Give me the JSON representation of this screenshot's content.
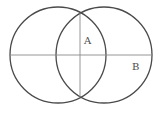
{
  "diagram": {
    "type": "two overlapping circles with perpendicular lines",
    "labels": {
      "a": "A",
      "b": "B"
    },
    "colors": {
      "circle_stroke": "#4a4a4a",
      "line_stroke": "#8a8a8a",
      "background": "#ffffff"
    }
  }
}
